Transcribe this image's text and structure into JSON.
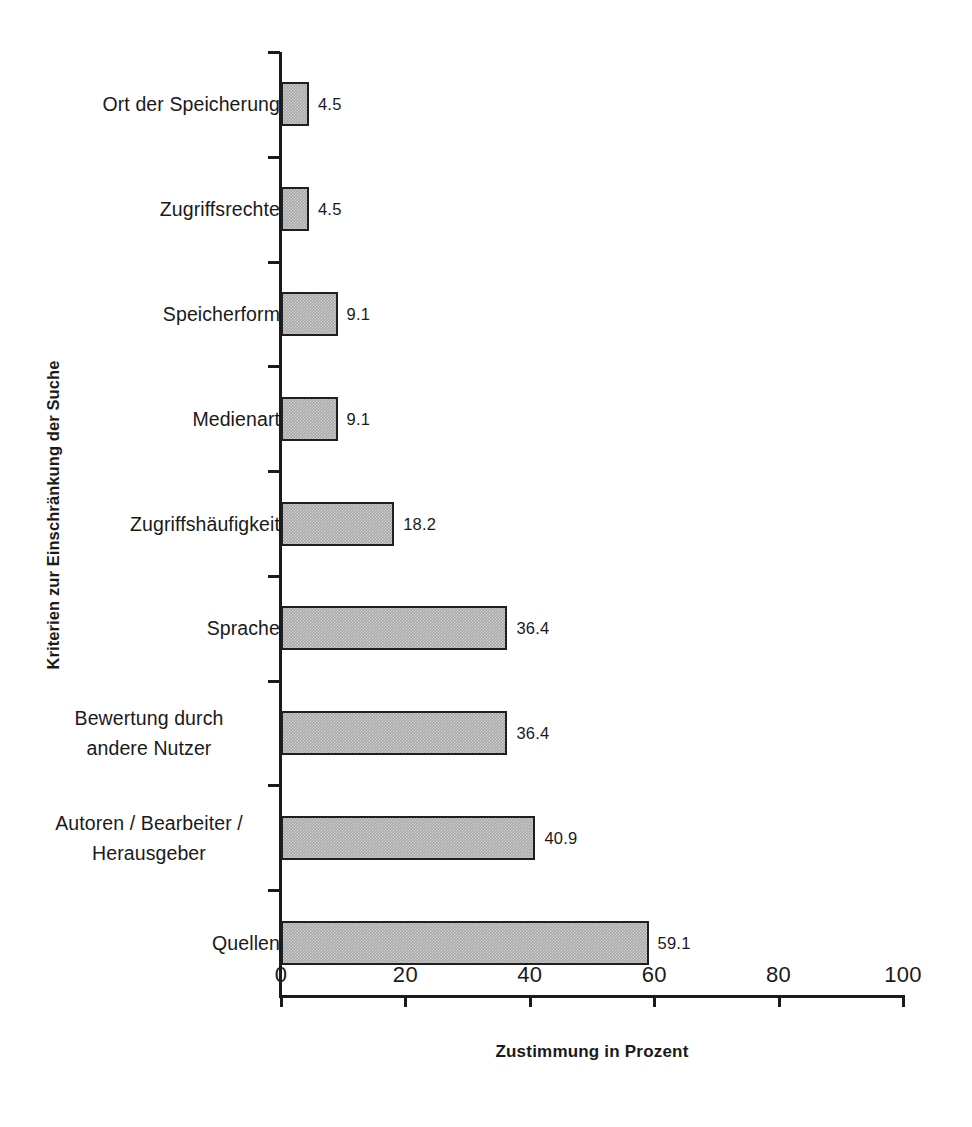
{
  "chart_data": {
    "type": "bar",
    "orientation": "horizontal",
    "title": "",
    "xlabel": "Zustimmung in Prozent",
    "ylabel": "Kriterien zur Einschränkung der Suche",
    "xlim": [
      0,
      100
    ],
    "xticks": [
      0,
      20,
      40,
      60,
      80,
      100
    ],
    "xtick_labels": [
      "0",
      "20",
      "40",
      "60",
      "80",
      "100"
    ],
    "grid": false,
    "legend": false,
    "bar_fill_color": "#a9a9a9",
    "bar_border_color": "#1f1f1f",
    "categories": [
      "Ort der Speicherung",
      "Zugriffsrechte",
      "Speicherform",
      "Medienart",
      "Zugriffshäufigkeit",
      "Sprache",
      "Bewertung durch andere Nutzer",
      "Autoren / Bearbeiter / Herausgeber",
      "Quellen"
    ],
    "category_label_lines": [
      [
        "Ort der Speicherung"
      ],
      [
        "Zugriffsrechte"
      ],
      [
        "Speicherform"
      ],
      [
        "Medienart"
      ],
      [
        "Zugriffshäufigkeit"
      ],
      [
        "Sprache"
      ],
      [
        "Bewertung durch",
        "andere Nutzer"
      ],
      [
        "Autoren / Bearbeiter /",
        "Herausgeber"
      ],
      [
        "Quellen"
      ]
    ],
    "values": [
      4.5,
      4.5,
      9.1,
      9.1,
      18.2,
      36.4,
      36.4,
      40.9,
      59.1
    ],
    "value_labels": [
      "4.5",
      "4.5",
      "9.1",
      "9.1",
      "18.2",
      "36.4",
      "36.4",
      "40.9",
      "59.1"
    ]
  }
}
